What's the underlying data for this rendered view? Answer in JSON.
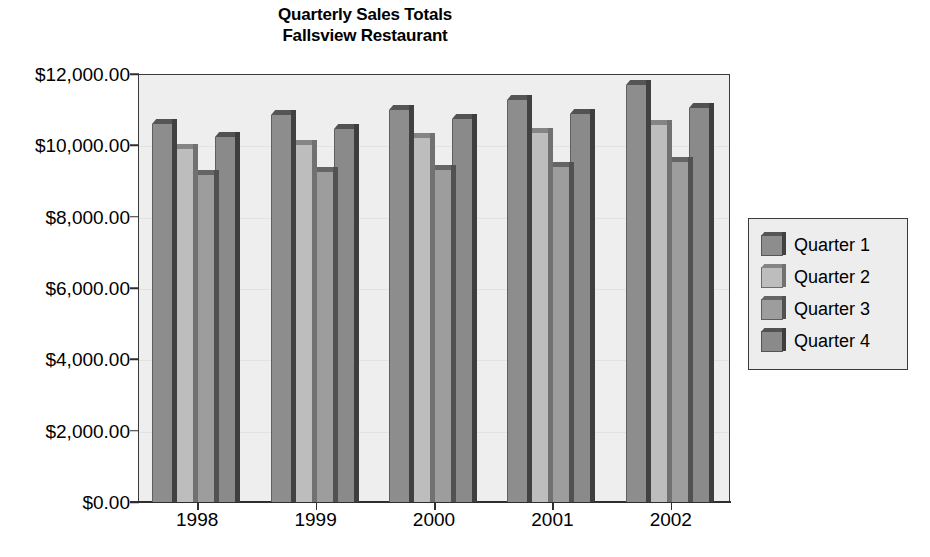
{
  "chart_data": {
    "type": "bar",
    "title": "Quarterly Sales Totals",
    "subtitle": "Fallsview Restaurant",
    "xlabel": "",
    "ylabel": "",
    "categories": [
      "1998",
      "1999",
      "2000",
      "2001",
      "2002"
    ],
    "series": [
      {
        "name": "Quarter 1",
        "color": "#8d8d8d",
        "values": [
          10600,
          10850,
          11000,
          11280,
          11680
        ]
      },
      {
        "name": "Quarter 2",
        "color": "#bdbdbd",
        "values": [
          9900,
          10000,
          10220,
          10340,
          10580
        ]
      },
      {
        "name": "Quarter 3",
        "color": "#9d9d9d",
        "values": [
          9180,
          9250,
          9300,
          9380,
          9540
        ]
      },
      {
        "name": "Quarter 4",
        "color": "#8a8a8a",
        "values": [
          10230,
          10470,
          10740,
          10880,
          11060
        ]
      }
    ],
    "ylim": [
      0,
      12000
    ],
    "yticks": [
      0,
      2000,
      4000,
      6000,
      8000,
      10000,
      12000
    ],
    "ytick_labels": [
      "$0.00",
      "$2,000.00",
      "$4,000.00",
      "$6,000.00",
      "$8,000.00",
      "$10,000.00",
      "$12,000.00"
    ],
    "grid": true,
    "legend_position": "right",
    "legend_entries": [
      "Quarter 1",
      "Quarter 2",
      "Quarter 3",
      "Quarter 4"
    ],
    "plot_background": "#eeeeee",
    "axis_color": "#3a3a3a"
  }
}
